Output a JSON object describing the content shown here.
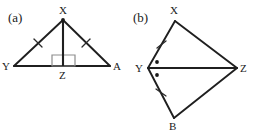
{
  "figure": {
    "width": 253,
    "height": 133,
    "background": "#ffffff",
    "ink_color": "#1f1f1f",
    "mark_color": "#2a2a2a",
    "right_angle_color": "#8d8d8d"
  },
  "panels": [
    {
      "key": "panel_a",
      "label": "(a)",
      "label_pos": {
        "x": 8,
        "y": 22
      },
      "shape": "triangle-with-altitude",
      "vertices": [
        {
          "name": "X",
          "x": 63,
          "y": 20,
          "label_x": 59,
          "label_y": 14,
          "has_dot": true
        },
        {
          "name": "Y",
          "x": 14,
          "y": 66,
          "label_x": 4,
          "label_y": 70,
          "has_dot": false
        },
        {
          "name": "A",
          "x": 110,
          "y": 66,
          "label_x": 113,
          "label_y": 70,
          "has_dot": false
        },
        {
          "name": "Z",
          "x": 63,
          "y": 66,
          "label_x": 59,
          "label_y": 79,
          "has_dot": false
        }
      ],
      "edges": [
        {
          "name": "XY",
          "from": "X",
          "to": "Y",
          "ticks": 1
        },
        {
          "name": "XA",
          "from": "X",
          "to": "A",
          "ticks": 1
        },
        {
          "name": "YA",
          "from": "Y",
          "to": "A",
          "ticks": 0
        }
      ],
      "altitude": {
        "name": "XZ",
        "from": "X",
        "to": "Z"
      },
      "right_angle": {
        "at": "Z",
        "size": 11,
        "side": "left"
      },
      "angle_dots": []
    },
    {
      "key": "panel_b",
      "label": "(b)",
      "label_pos": {
        "x": 133,
        "y": 22
      },
      "shape": "kite-with-diagonal",
      "vertices": [
        {
          "name": "X",
          "x": 175,
          "y": 21,
          "label_x": 170,
          "label_y": 14,
          "has_dot": false
        },
        {
          "name": "Y",
          "x": 148,
          "y": 68,
          "label_x": 136,
          "label_y": 72,
          "has_dot": false
        },
        {
          "name": "Z",
          "x": 237,
          "y": 68,
          "label_x": 240,
          "label_y": 72,
          "has_dot": false
        },
        {
          "name": "B",
          "x": 174,
          "y": 118,
          "label_x": 169,
          "label_y": 130,
          "has_dot": false
        }
      ],
      "edges": [
        {
          "name": "YX",
          "from": "Y",
          "to": "X",
          "ticks": 1
        },
        {
          "name": "XZ",
          "from": "X",
          "to": "Z",
          "ticks": 0
        },
        {
          "name": "YB",
          "from": "Y",
          "to": "B",
          "ticks": 1
        },
        {
          "name": "BZ",
          "from": "B",
          "to": "Z",
          "ticks": 0
        }
      ],
      "diagonal": {
        "name": "YZ",
        "from": "Y",
        "to": "Z"
      },
      "right_angle": null,
      "angle_dots": [
        {
          "name": "angle-XYZ-dot",
          "x": 157,
          "y": 62,
          "r": 1.9
        },
        {
          "name": "angle-ZYB-dot",
          "x": 157,
          "y": 75,
          "r": 1.9
        }
      ]
    }
  ],
  "marks": {
    "panel_a_ticks": [
      {
        "name": "tick-XY",
        "cx": 38,
        "cy": 43,
        "angle": -43,
        "len": 9
      },
      {
        "name": "tick-XA",
        "cx": 86,
        "cy": 43,
        "angle": 43,
        "len": 9
      }
    ],
    "panel_b_ticks": [
      {
        "name": "tick-YX",
        "cx": 161,
        "cy": 44,
        "angle": -60,
        "len": 9
      },
      {
        "name": "tick-YB",
        "cx": 161,
        "cy": 93,
        "angle": 62,
        "len": 9
      }
    ]
  }
}
